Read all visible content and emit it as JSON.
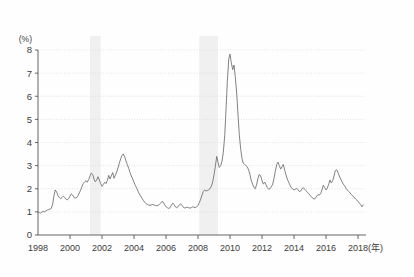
{
  "chart_data": {
    "type": "line",
    "title": "",
    "subtitle": "",
    "xlabel": "(年)",
    "ylabel": "(%)",
    "ylim": [
      0,
      8
    ],
    "xlim": [
      1998.0,
      2018.5
    ],
    "grid": "horizontal-dotted",
    "legend": "none",
    "y_ticks": [
      "0",
      "1",
      "2",
      "3",
      "4",
      "5",
      "6",
      "7",
      "8"
    ],
    "y_tick_values": [
      0,
      1,
      2,
      3,
      4,
      5,
      6,
      7,
      8
    ],
    "x_ticks": [
      "1998",
      "2000",
      "2002",
      "2004",
      "2006",
      "2008",
      "2010",
      "2012",
      "2014",
      "2016",
      "2018"
    ],
    "x_tick_values": [
      1998,
      2000,
      2002,
      2004,
      2006,
      2008,
      2010,
      2012,
      2014,
      2016,
      2018
    ],
    "line_color": "#6b6b6b",
    "shading_color": "#f0f0f0",
    "axis_color": "#555555",
    "grid_color": "#d8d8d8",
    "shaded_bands": [
      {
        "start": 2001.25,
        "end": 2001.92
      },
      {
        "start": 2008.08,
        "end": 2009.25
      }
    ],
    "series": [
      {
        "name": "rate",
        "x": [
          1998.0,
          1998.08,
          1998.17,
          1998.25,
          1998.33,
          1998.42,
          1998.5,
          1998.58,
          1998.67,
          1998.75,
          1998.83,
          1998.92,
          1999.0,
          1999.08,
          1999.17,
          1999.25,
          1999.33,
          1999.42,
          1999.5,
          1999.58,
          1999.67,
          1999.75,
          1999.83,
          1999.92,
          2000.0,
          2000.08,
          2000.17,
          2000.25,
          2000.33,
          2000.42,
          2000.5,
          2000.58,
          2000.67,
          2000.75,
          2000.83,
          2000.92,
          2001.0,
          2001.08,
          2001.17,
          2001.25,
          2001.33,
          2001.42,
          2001.5,
          2001.58,
          2001.67,
          2001.75,
          2001.83,
          2001.92,
          2002.0,
          2002.08,
          2002.17,
          2002.25,
          2002.33,
          2002.42,
          2002.5,
          2002.58,
          2002.67,
          2002.75,
          2002.83,
          2002.92,
          2003.0,
          2003.08,
          2003.17,
          2003.25,
          2003.33,
          2003.42,
          2003.5,
          2003.58,
          2003.67,
          2003.75,
          2003.83,
          2003.92,
          2004.0,
          2004.08,
          2004.17,
          2004.25,
          2004.33,
          2004.42,
          2004.5,
          2004.58,
          2004.67,
          2004.75,
          2004.83,
          2004.92,
          2005.0,
          2005.08,
          2005.17,
          2005.25,
          2005.33,
          2005.42,
          2005.5,
          2005.58,
          2005.67,
          2005.75,
          2005.83,
          2005.92,
          2006.0,
          2006.08,
          2006.17,
          2006.25,
          2006.33,
          2006.42,
          2006.5,
          2006.58,
          2006.67,
          2006.75,
          2006.83,
          2006.92,
          2007.0,
          2007.08,
          2007.17,
          2007.25,
          2007.33,
          2007.42,
          2007.5,
          2007.58,
          2007.67,
          2007.75,
          2007.83,
          2007.92,
          2008.0,
          2008.08,
          2008.17,
          2008.25,
          2008.33,
          2008.42,
          2008.5,
          2008.58,
          2008.67,
          2008.75,
          2008.83,
          2008.92,
          2009.0,
          2009.08,
          2009.17,
          2009.25,
          2009.33,
          2009.42,
          2009.5,
          2009.58,
          2009.67,
          2009.75,
          2009.83,
          2009.92,
          2010.0,
          2010.08,
          2010.17,
          2010.25,
          2010.33,
          2010.42,
          2010.5,
          2010.58,
          2010.67,
          2010.75,
          2010.83,
          2010.92,
          2011.0,
          2011.08,
          2011.17,
          2011.25,
          2011.33,
          2011.42,
          2011.5,
          2011.58,
          2011.67,
          2011.75,
          2011.83,
          2011.92,
          2012.0,
          2012.08,
          2012.17,
          2012.25,
          2012.33,
          2012.42,
          2012.5,
          2012.58,
          2012.67,
          2012.75,
          2012.83,
          2012.92,
          2013.0,
          2013.08,
          2013.17,
          2013.25,
          2013.33,
          2013.42,
          2013.5,
          2013.58,
          2013.67,
          2013.75,
          2013.83,
          2013.92,
          2014.0,
          2014.08,
          2014.17,
          2014.25,
          2014.33,
          2014.42,
          2014.5,
          2014.58,
          2014.67,
          2014.75,
          2014.83,
          2014.92,
          2015.0,
          2015.08,
          2015.17,
          2015.25,
          2015.33,
          2015.42,
          2015.5,
          2015.58,
          2015.67,
          2015.75,
          2015.83,
          2015.92,
          2016.0,
          2016.08,
          2016.17,
          2016.25,
          2016.33,
          2016.42,
          2016.5,
          2016.58,
          2016.67,
          2016.75,
          2016.83,
          2016.92,
          2017.0,
          2017.08,
          2017.17,
          2017.25,
          2017.33,
          2017.42,
          2017.5,
          2017.58,
          2017.67,
          2017.75,
          2017.83,
          2017.92,
          2018.0,
          2018.08,
          2018.17,
          2018.25,
          2018.33
        ],
        "values": [
          1.0,
          0.97,
          0.95,
          1.0,
          1.02,
          1.0,
          1.05,
          1.08,
          1.1,
          1.12,
          1.15,
          1.35,
          1.72,
          1.95,
          1.85,
          1.7,
          1.62,
          1.58,
          1.62,
          1.68,
          1.62,
          1.55,
          1.52,
          1.58,
          1.68,
          1.78,
          1.72,
          1.62,
          1.6,
          1.62,
          1.7,
          1.82,
          1.95,
          2.1,
          2.22,
          2.3,
          2.35,
          2.28,
          2.4,
          2.55,
          2.68,
          2.62,
          2.42,
          2.3,
          2.38,
          2.52,
          2.38,
          2.22,
          2.1,
          2.18,
          2.28,
          2.22,
          2.35,
          2.58,
          2.42,
          2.55,
          2.7,
          2.45,
          2.58,
          2.72,
          2.9,
          3.1,
          3.3,
          3.45,
          3.5,
          3.38,
          3.2,
          3.05,
          2.88,
          2.7,
          2.55,
          2.42,
          2.28,
          2.15,
          2.02,
          1.9,
          1.78,
          1.68,
          1.58,
          1.5,
          1.42,
          1.36,
          1.32,
          1.3,
          1.28,
          1.3,
          1.32,
          1.3,
          1.28,
          1.26,
          1.28,
          1.32,
          1.38,
          1.45,
          1.42,
          1.3,
          1.22,
          1.18,
          1.15,
          1.18,
          1.28,
          1.38,
          1.32,
          1.22,
          1.18,
          1.22,
          1.3,
          1.35,
          1.28,
          1.2,
          1.17,
          1.18,
          1.2,
          1.18,
          1.16,
          1.18,
          1.22,
          1.2,
          1.18,
          1.22,
          1.28,
          1.4,
          1.55,
          1.72,
          1.88,
          1.95,
          1.9,
          1.92,
          1.96,
          2.0,
          2.1,
          2.3,
          2.6,
          2.95,
          3.4,
          3.15,
          2.92,
          3.0,
          3.2,
          3.55,
          4.3,
          5.4,
          6.6,
          7.6,
          7.82,
          7.45,
          7.15,
          7.35,
          6.85,
          6.1,
          5.2,
          4.35,
          3.7,
          3.3,
          3.1,
          3.05,
          3.0,
          2.95,
          2.8,
          2.6,
          2.35,
          2.18,
          2.05,
          2.0,
          2.2,
          2.45,
          2.62,
          2.55,
          2.35,
          2.2,
          2.28,
          2.18,
          2.05,
          1.98,
          2.0,
          2.08,
          2.2,
          2.45,
          2.75,
          3.05,
          3.15,
          3.0,
          2.85,
          2.95,
          3.05,
          2.8,
          2.6,
          2.42,
          2.28,
          2.15,
          2.05,
          1.98,
          1.95,
          1.98,
          2.02,
          1.95,
          1.88,
          1.9,
          2.0,
          2.05,
          1.98,
          1.92,
          1.85,
          1.78,
          1.72,
          1.65,
          1.6,
          1.55,
          1.58,
          1.68,
          1.75,
          1.72,
          1.8,
          1.95,
          2.15,
          2.05,
          1.95,
          2.02,
          2.2,
          2.38,
          2.25,
          2.35,
          2.55,
          2.78,
          2.82,
          2.7,
          2.55,
          2.42,
          2.3,
          2.2,
          2.12,
          2.02,
          1.95,
          1.88,
          1.82,
          1.75,
          1.7,
          1.62,
          1.58,
          1.52,
          1.45,
          1.38,
          1.32,
          1.22,
          1.3
        ]
      }
    ],
    "annotations": [],
    "notable_points": [
      {
        "label": "series start",
        "x": 1998.0,
        "y": 1.0
      },
      {
        "label": "2002 peak",
        "x": 2002.92,
        "y": 3.5
      },
      {
        "label": "mid-decade trough",
        "x": 2006.17,
        "y": 1.15
      },
      {
        "label": "crisis peak",
        "x": 2009.0,
        "y": 7.82
      },
      {
        "label": "2012 peak",
        "x": 2012.0,
        "y": 3.15
      },
      {
        "label": "2016 peak",
        "x": 2016.58,
        "y": 2.82
      },
      {
        "label": "series end",
        "x": 2018.33,
        "y": 1.3
      }
    ]
  }
}
